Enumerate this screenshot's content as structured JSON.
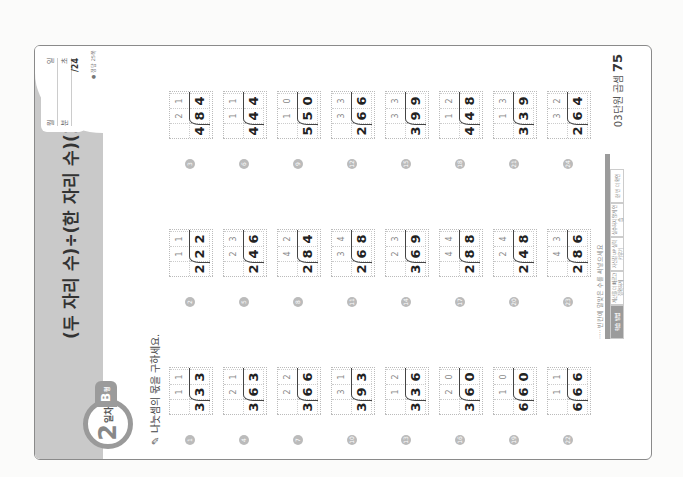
{
  "header": {
    "title": "(두 자리 수)÷(한 자리 수)(1)",
    "score": {
      "row1_left": "월",
      "row1_right": "일",
      "row2_left": "분",
      "row2_right": "초",
      "total": "/24"
    },
    "answer_ref": "● 정답 25쪽"
  },
  "day_badge": {
    "number": "2",
    "label": "일차"
  },
  "type_badge": {
    "letter": "B",
    "suffix": "형"
  },
  "instruction": "나눗셈의 몫을 구하세요.",
  "problems": [
    {
      "n": "1",
      "divisor": "3",
      "dividend": [
        "3",
        "3"
      ],
      "quotient": [
        "1",
        "1"
      ]
    },
    {
      "n": "2",
      "divisor": "2",
      "dividend": [
        "2",
        "2"
      ],
      "quotient": [
        "1",
        "1"
      ]
    },
    {
      "n": "3",
      "divisor": "4",
      "dividend": [
        "8",
        "4"
      ],
      "quotient": [
        "2",
        "1"
      ]
    },
    {
      "n": "4",
      "divisor": "3",
      "dividend": [
        "6",
        "3"
      ],
      "quotient": [
        "2",
        "1"
      ]
    },
    {
      "n": "5",
      "divisor": "2",
      "dividend": [
        "4",
        "6"
      ],
      "quotient": [
        "2",
        "3"
      ]
    },
    {
      "n": "6",
      "divisor": "4",
      "dividend": [
        "4",
        "4"
      ],
      "quotient": [
        "1",
        "1"
      ]
    },
    {
      "n": "7",
      "divisor": "3",
      "dividend": [
        "6",
        "6"
      ],
      "quotient": [
        "2",
        "2"
      ]
    },
    {
      "n": "8",
      "divisor": "2",
      "dividend": [
        "8",
        "4"
      ],
      "quotient": [
        "4",
        "2"
      ]
    },
    {
      "n": "9",
      "divisor": "5",
      "dividend": [
        "5",
        "0"
      ],
      "quotient": [
        "1",
        "0"
      ]
    },
    {
      "n": "10",
      "divisor": "3",
      "dividend": [
        "9",
        "3"
      ],
      "quotient": [
        "3",
        "1"
      ]
    },
    {
      "n": "11",
      "divisor": "2",
      "dividend": [
        "6",
        "8"
      ],
      "quotient": [
        "3",
        "4"
      ]
    },
    {
      "n": "12",
      "divisor": "2",
      "dividend": [
        "6",
        "6"
      ],
      "quotient": [
        "3",
        "3"
      ]
    },
    {
      "n": "13",
      "divisor": "3",
      "dividend": [
        "3",
        "6"
      ],
      "quotient": [
        "1",
        "2"
      ]
    },
    {
      "n": "14",
      "divisor": "3",
      "dividend": [
        "6",
        "9"
      ],
      "quotient": [
        "2",
        "3"
      ]
    },
    {
      "n": "15",
      "divisor": "3",
      "dividend": [
        "9",
        "9"
      ],
      "quotient": [
        "3",
        "3"
      ]
    },
    {
      "n": "16",
      "divisor": "3",
      "dividend": [
        "6",
        "0"
      ],
      "quotient": [
        "2",
        "0"
      ]
    },
    {
      "n": "17",
      "divisor": "2",
      "dividend": [
        "8",
        "8"
      ],
      "quotient": [
        "4",
        "4"
      ]
    },
    {
      "n": "18",
      "divisor": "4",
      "dividend": [
        "4",
        "8"
      ],
      "quotient": [
        "1",
        "2"
      ]
    },
    {
      "n": "19",
      "divisor": "6",
      "dividend": [
        "6",
        "0"
      ],
      "quotient": [
        "1",
        "0"
      ]
    },
    {
      "n": "20",
      "divisor": "2",
      "dividend": [
        "4",
        "8"
      ],
      "quotient": [
        "2",
        "4"
      ]
    },
    {
      "n": "21",
      "divisor": "3",
      "dividend": [
        "3",
        "9"
      ],
      "quotient": [
        "1",
        "3"
      ]
    },
    {
      "n": "22",
      "divisor": "6",
      "dividend": [
        "6",
        "6"
      ],
      "quotient": [
        "1",
        "1"
      ]
    },
    {
      "n": "23",
      "divisor": "2",
      "dividend": [
        "8",
        "6"
      ],
      "quotient": [
        "4",
        "3"
      ]
    },
    {
      "n": "24",
      "divisor": "2",
      "dividend": [
        "6",
        "4"
      ],
      "quotient": [
        "3",
        "2"
      ]
    }
  ],
  "footer": {
    "note": "····· 빈칸에 알맞은 수를 써넣으세요",
    "tabs": [
      "학습 방법",
      "계산을 더 빠르고 정확하게",
      "자신감 UP 실력 키우기",
      "실수하지 않게 연습",
      "한 번 더 확인"
    ]
  },
  "page": {
    "label": "03단원 곱셈",
    "number": "75"
  }
}
